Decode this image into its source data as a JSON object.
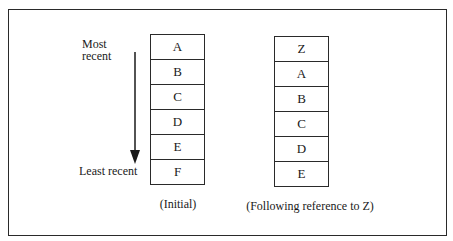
{
  "diagram": {
    "type": "LRU stack",
    "left_stack": {
      "items": [
        "A",
        "B",
        "C",
        "D",
        "E",
        "F"
      ],
      "caption": "(Initial)"
    },
    "right_stack": {
      "items": [
        "Z",
        "A",
        "B",
        "C",
        "D",
        "E"
      ],
      "caption": "(Following reference to Z)"
    },
    "axis": {
      "top_label_line1": "Most",
      "top_label_line2": "recent",
      "bottom_label": "Least recent",
      "direction": "down-arrow-icon"
    }
  }
}
